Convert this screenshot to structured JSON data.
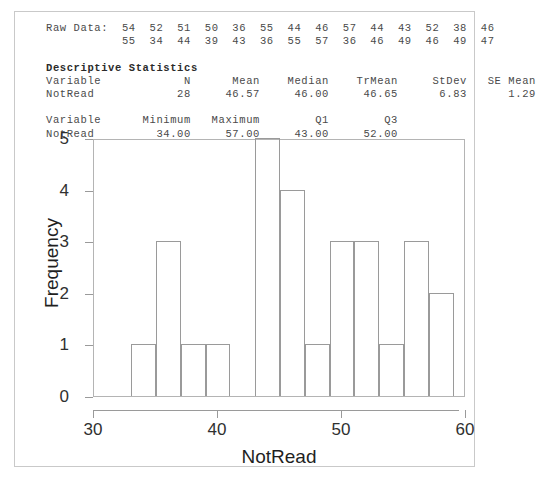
{
  "text_output": {
    "raw_data_label": "Raw Data:",
    "raw_data_row1": "54  52  51  50  36  55  44  46  57  44  43  52  38  46",
    "raw_data_row2": "55  34  44  39  43  36  55  57  36  46  49  46  49  47",
    "raw_data_values": [
      54,
      52,
      51,
      50,
      36,
      55,
      44,
      46,
      57,
      44,
      43,
      52,
      38,
      46,
      55,
      34,
      44,
      39,
      43,
      36,
      55,
      57,
      36,
      46,
      49,
      46,
      49,
      47
    ],
    "descriptive_heading": "Descriptive Statistics",
    "table1_header": "Variable            N      Mean    Median    TrMean     StDev   SE Mean",
    "table1_row": "NotRead            28     46.57     46.00     46.65      6.83      1.29",
    "table2_header": "Variable      Minimum   Maximum        Q1        Q3",
    "table2_row": "NotRead         34.00     57.00     43.00     52.00",
    "stats": {
      "variable": "NotRead",
      "n": "28",
      "mean": "46.57",
      "median": "46.00",
      "trmean": "46.65",
      "stdev": "6.83",
      "se_mean": "1.29",
      "minimum": "34.00",
      "maximum": "57.00",
      "q1": "43.00",
      "q3": "52.00"
    }
  },
  "chart_data": {
    "type": "bar",
    "title": "",
    "xlabel": "NotRead",
    "ylabel": "Frequency",
    "xlim": [
      30,
      60
    ],
    "ylim": [
      0,
      5
    ],
    "xticks": [
      30,
      40,
      50,
      60
    ],
    "xtick_labels": [
      "30",
      "40",
      "50",
      "60"
    ],
    "yticks": [
      0,
      1,
      2,
      3,
      4,
      5
    ],
    "ytick_labels": [
      "0",
      "1",
      "2",
      "3",
      "4",
      "5"
    ],
    "grid": false,
    "legend": "none",
    "bin_width": 2,
    "bin_starts": [
      33,
      35,
      37,
      39,
      41,
      43,
      45,
      47,
      49,
      51,
      53,
      55,
      57
    ],
    "bin_ends": [
      35,
      37,
      39,
      41,
      43,
      45,
      47,
      49,
      51,
      53,
      55,
      57,
      59
    ],
    "categories": [
      "33-35",
      "35-37",
      "37-39",
      "39-41",
      "41-43",
      "43-45",
      "45-47",
      "47-49",
      "49-51",
      "51-53",
      "53-55",
      "55-57",
      "57-59"
    ],
    "values": [
      1,
      3,
      1,
      1,
      0,
      5,
      4,
      1,
      3,
      3,
      1,
      3,
      2
    ]
  },
  "colors": {
    "border": "#c9c9c9",
    "axis": "#9a9a9a",
    "frame": "#b4b4b4",
    "text": "#1f1f1f",
    "mono_text": "#4a4a4a"
  }
}
